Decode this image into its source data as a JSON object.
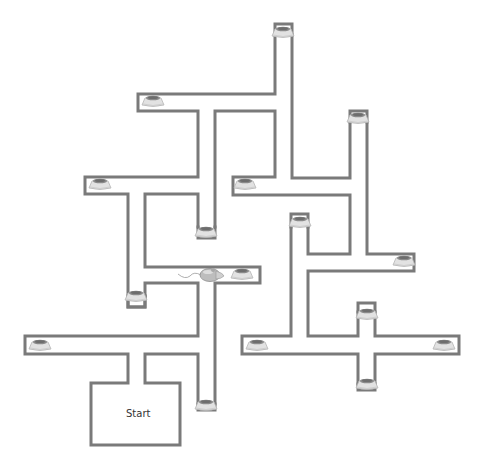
{
  "diagram": {
    "type": "maze",
    "background": "#ffffff",
    "wall_color": "#7a7a7a",
    "start_label": "Start",
    "start_label_pos": {
      "x": 126,
      "y": 408
    },
    "walls": [
      [
        [
          275,
          35
        ],
        [
          275,
          24
        ],
        [
          292,
          24
        ],
        [
          292,
          35
        ]
      ],
      [
        [
          275,
          35
        ],
        [
          275,
          94
        ],
        [
          138,
          94
        ],
        [
          138,
          111
        ],
        [
          198,
          111
        ],
        [
          198,
          177
        ],
        [
          85,
          177
        ],
        [
          85,
          194
        ],
        [
          128,
          194
        ],
        [
          128,
          307
        ],
        [
          145,
          307
        ],
        [
          145,
          291
        ]
      ],
      [
        [
          292,
          35
        ],
        [
          292,
          178
        ],
        [
          350,
          178
        ],
        [
          350,
          122
        ]
      ],
      [
        [
          350,
          111
        ],
        [
          367,
          111
        ],
        [
          367,
          122
        ]
      ],
      [
        [
          367,
          122
        ],
        [
          367,
          254
        ],
        [
          414,
          254
        ],
        [
          414,
          271
        ],
        [
          308,
          271
        ],
        [
          308,
          336
        ],
        [
          414,
          336
        ],
        [
          414,
          354
        ]
      ],
      [
        [
          414,
          354
        ],
        [
          308,
          354
        ],
        [
          308,
          354
        ]
      ],
      [
        [
          215,
          227
        ],
        [
          215,
          111
        ],
        [
          275,
          111
        ],
        [
          275,
          177
        ],
        [
          233,
          177
        ],
        [
          233,
          195
        ],
        [
          350,
          195
        ],
        [
          350,
          254
        ],
        [
          308,
          254
        ],
        [
          308,
          227
        ]
      ],
      [
        [
          291,
          227
        ],
        [
          291,
          214
        ],
        [
          308,
          214
        ],
        [
          308,
          227
        ]
      ],
      [
        [
          291,
          227
        ],
        [
          291,
          336
        ],
        [
          242,
          336
        ],
        [
          242,
          354
        ],
        [
          358,
          354
        ],
        [
          358,
          390
        ],
        [
          375,
          390
        ],
        [
          375,
          354
        ],
        [
          459,
          354
        ],
        [
          459,
          336
        ],
        [
          375,
          336
        ],
        [
          375,
          312
        ]
      ],
      [
        [
          358,
          312
        ],
        [
          358,
          336
        ]
      ],
      [
        [
          358,
          312
        ],
        [
          358,
          303
        ],
        [
          375,
          303
        ],
        [
          375,
          312
        ]
      ],
      [
        [
          198,
          227
        ],
        [
          198,
          238
        ],
        [
          215,
          238
        ],
        [
          215,
          227
        ]
      ],
      [
        [
          145,
          291
        ],
        [
          145,
          283
        ],
        [
          198,
          283
        ],
        [
          198,
          336
        ],
        [
          25,
          336
        ],
        [
          25,
          354
        ],
        [
          128,
          354
        ],
        [
          128,
          383
        ],
        [
          91,
          383
        ],
        [
          91,
          445
        ],
        [
          180,
          445
        ],
        [
          180,
          383
        ],
        [
          145,
          383
        ],
        [
          145,
          354
        ],
        [
          198,
          354
        ],
        [
          198,
          410
        ],
        [
          215,
          410
        ],
        [
          215,
          283
        ],
        [
          260,
          283
        ],
        [
          260,
          267
        ],
        [
          145,
          267
        ],
        [
          145,
          194
        ],
        [
          198,
          194
        ],
        [
          198,
          227
        ]
      ]
    ],
    "bowls": [
      {
        "x": 283,
        "y": 32
      },
      {
        "x": 153,
        "y": 101
      },
      {
        "x": 358,
        "y": 118
      },
      {
        "x": 100,
        "y": 184
      },
      {
        "x": 245,
        "y": 184
      },
      {
        "x": 300,
        "y": 222
      },
      {
        "x": 206,
        "y": 232
      },
      {
        "x": 242,
        "y": 274
      },
      {
        "x": 404,
        "y": 261
      },
      {
        "x": 136,
        "y": 296
      },
      {
        "x": 367,
        "y": 314
      },
      {
        "x": 40,
        "y": 345
      },
      {
        "x": 257,
        "y": 345
      },
      {
        "x": 444,
        "y": 345
      },
      {
        "x": 206,
        "y": 405
      },
      {
        "x": 367,
        "y": 384
      }
    ],
    "mouse": {
      "x": 210,
      "y": 275,
      "facing": "right"
    }
  }
}
